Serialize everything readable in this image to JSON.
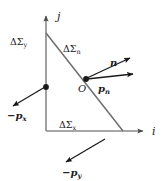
{
  "figure": {
    "background_color": "#ffffff",
    "line_color": "#6e6e6e",
    "vector_color": "#1a1a1a",
    "text_color": "#1a1a1a"
  },
  "axes": {
    "vertical": {
      "name": "j-axis",
      "label": "j",
      "label_x": 57,
      "label_y": 20,
      "x": 46,
      "y_top": 14,
      "y_bottom": 131
    },
    "horizontal": {
      "name": "i-axis",
      "label": "i",
      "label_x": 152,
      "label_y": 135,
      "y": 131,
      "x_left": 46,
      "x_right": 145
    }
  },
  "surfaces": [
    {
      "name": "delta-sigma-y",
      "symbol": "ΔΣ",
      "subscript": "y",
      "x": 10,
      "y": 45
    },
    {
      "name": "delta-sigma-n",
      "symbol": "ΔΣ",
      "subscript": "n",
      "x": 63,
      "y": 52
    },
    {
      "name": "delta-sigma-x",
      "symbol": "ΔΣ",
      "subscript": "x",
      "x": 59,
      "y": 128
    }
  ],
  "origin_point": {
    "name": "origin-O",
    "label": "O",
    "point_x": 86,
    "point_y": 79,
    "label_x": 78,
    "label_y": 92
  },
  "hypotenuse": {
    "name": "inclined-face-line",
    "x1": 46,
    "y1": 33,
    "x2": 123,
    "y2": 131
  },
  "vectors": [
    {
      "name": "normal-vector-n",
      "label": "n",
      "subscript": "",
      "x1": 86,
      "y1": 79,
      "x2": 133,
      "y2": 56,
      "label_x": 110,
      "label_y": 66
    },
    {
      "name": "traction-vector-pn",
      "label": "p",
      "subscript": "n",
      "x1": 86,
      "y1": 79,
      "x2": 136,
      "y2": 73,
      "label_x": 98,
      "label_y": 92
    },
    {
      "name": "traction-vector-minus-px",
      "label": "−p",
      "subscript": "x",
      "x1": 46,
      "y1": 87,
      "x2": 10,
      "y2": 108,
      "label_x": 7,
      "label_y": 119,
      "dot_x": 46,
      "dot_y": 87
    },
    {
      "name": "traction-vector-minus-py",
      "label": "−p",
      "subscript": "y",
      "x1": 105,
      "y1": 139,
      "x2": 62,
      "y2": 165,
      "label_x": 62,
      "label_y": 176
    }
  ]
}
